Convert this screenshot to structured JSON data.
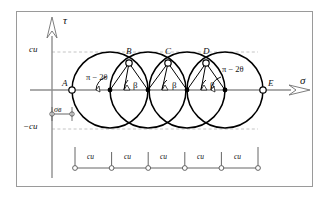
{
  "figure": {
    "title_axes": {
      "y_axis_label": "τ",
      "x_axis_label": "σ"
    },
    "axis_ticks": [
      {
        "name": "tau-positive-tick",
        "label": "cи",
        "value": "cи"
      },
      {
        "name": "tau-negative-tick",
        "label": "−cи",
        "value": "-cи"
      }
    ],
    "points": [
      {
        "id": "A",
        "label": "A",
        "x": 72,
        "y": 90
      },
      {
        "id": "B",
        "label": "B",
        "x": 129,
        "y": 63
      },
      {
        "id": "C",
        "label": "C",
        "x": 168,
        "y": 63
      },
      {
        "id": "D",
        "label": "D",
        "x": 206,
        "y": 63
      },
      {
        "id": "E",
        "label": "E",
        "x": 263,
        "y": 90
      }
    ],
    "circles": [
      {
        "cx": 110,
        "cy": 90,
        "r": 38
      },
      {
        "cx": 148,
        "cy": 90,
        "r": 38
      },
      {
        "cx": 187,
        "cy": 90,
        "r": 38
      },
      {
        "cx": 225,
        "cy": 90,
        "r": 38
      }
    ],
    "angle_labels": [
      {
        "name": "angle-pi-minus-2theta-left",
        "text": "π − 2θ"
      },
      {
        "name": "angle-beta-1",
        "text": "β"
      },
      {
        "name": "angle-beta-2",
        "text": "β"
      },
      {
        "name": "angle-beta-3",
        "text": "β"
      },
      {
        "name": "angle-pi-minus-2theta-right",
        "text": "π − 2θ"
      }
    ],
    "offset_dimension": {
      "name": "sigma-v-dimension",
      "label": "σв"
    },
    "scale_bar": {
      "segments": [
        {
          "label": "cи"
        },
        {
          "label": "cи"
        },
        {
          "label": "cи"
        },
        {
          "label": "cи"
        },
        {
          "label": "cи"
        }
      ],
      "node_count": 6
    },
    "colors": {
      "frame": "#9a9a9a",
      "axis": "#8a8a8a",
      "curve": "#000000",
      "dashed": "#b9b9b9",
      "text": "#111111"
    }
  }
}
